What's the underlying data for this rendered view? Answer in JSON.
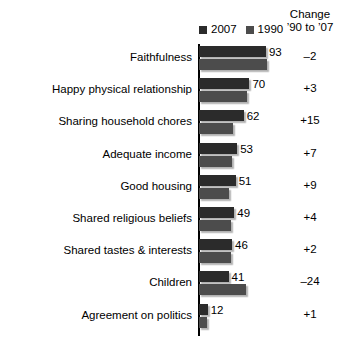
{
  "legend": {
    "entries": [
      {
        "label": "2007",
        "color": "#2b2b2b"
      },
      {
        "label": "1990",
        "color": "#4c4c4c"
      }
    ]
  },
  "change_column": {
    "header_line1": "Change",
    "header_line2": "’90 to ’07"
  },
  "chart_data": {
    "type": "bar",
    "orientation": "horizontal",
    "title": "",
    "xlabel": "",
    "ylabel": "",
    "xlim": [
      0,
      100
    ],
    "grid": false,
    "legend_position": "top",
    "categories": [
      "Faithfulness",
      "Happy physical relationship",
      "Sharing household chores",
      "Adequate income",
      "Good housing",
      "Shared religious beliefs",
      "Shared tastes & interests",
      "Children",
      "Agreement on politics"
    ],
    "series": [
      {
        "name": "2007",
        "color": "#2b2b2b",
        "values": [
          93,
          70,
          62,
          53,
          51,
          49,
          46,
          41,
          12
        ]
      },
      {
        "name": "1990",
        "color": "#4c4c4c",
        "values": [
          95,
          67,
          47,
          46,
          42,
          45,
          44,
          65,
          11
        ]
      }
    ],
    "value_labels": [
      "93",
      "70",
      "62",
      "53",
      "51",
      "49",
      "46",
      "41",
      "12"
    ],
    "change_labels": [
      "–2",
      "+3",
      "+15",
      "+7",
      "+9",
      "+4",
      "+2",
      "–24",
      "+1"
    ]
  }
}
